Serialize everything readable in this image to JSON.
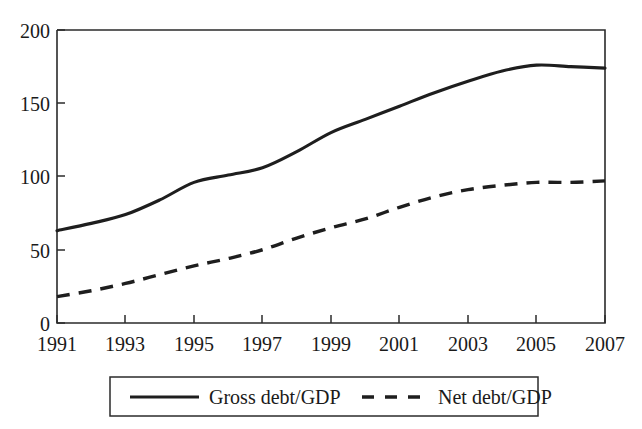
{
  "chart_data": {
    "type": "line",
    "title": "",
    "subtitle": "",
    "xlabel": "",
    "ylabel": "",
    "xlim": [
      1991,
      2007
    ],
    "ylim": [
      0,
      200
    ],
    "grid": false,
    "legend_position": "bottom",
    "x": [
      1991,
      1992,
      1993,
      1994,
      1995,
      1996,
      1997,
      1998,
      1999,
      2000,
      2001,
      2002,
      2003,
      2004,
      2005,
      2006,
      2007
    ],
    "y_ticks": [
      0,
      50,
      100,
      150,
      200
    ],
    "y_tick_labels": [
      "0",
      "50",
      "100",
      "150",
      "200"
    ],
    "x_ticks": [
      1991,
      1993,
      1995,
      1997,
      1999,
      2001,
      2003,
      2005,
      2007
    ],
    "x_tick_labels": [
      "1991",
      "1993",
      "1995",
      "1997",
      "1999",
      "2001",
      "2003",
      "2005",
      "2007"
    ],
    "series": [
      {
        "name": "Gross debt/GDP",
        "style": "solid",
        "color": "#1e1e1e",
        "values": [
          63,
          68,
          74,
          84,
          96,
          101,
          106,
          117,
          130,
          139,
          148,
          157,
          165,
          172,
          176,
          175,
          174
        ]
      },
      {
        "name": "Net debt/GDP",
        "style": "dashed",
        "color": "#1e1e1e",
        "values": [
          18,
          22,
          27,
          33,
          39,
          44,
          50,
          58,
          65,
          71,
          79,
          86,
          91,
          94,
          96,
          96,
          97
        ]
      }
    ],
    "annotations": []
  },
  "legend": {
    "items": [
      {
        "label": "Gross debt/GDP",
        "style": "solid"
      },
      {
        "label": "Net debt/GDP",
        "style": "dashed"
      }
    ]
  },
  "axis": {
    "y_labels": [
      "200",
      "150",
      "100",
      "50",
      "0"
    ],
    "x_labels": [
      "1991",
      "1993",
      "1995",
      "1997",
      "1999",
      "2001",
      "2003",
      "2005",
      "2007"
    ]
  },
  "colors": {
    "ink": "#1e1e1e",
    "axis": "#2b2b2b",
    "background": "#ffffff"
  }
}
